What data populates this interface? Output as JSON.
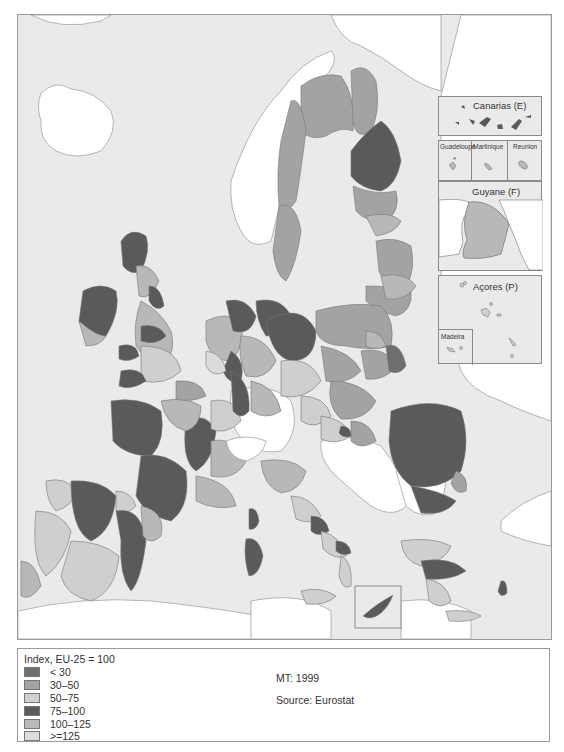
{
  "map": {
    "title": "Regional index map of the EU-25 (NUTS regions)",
    "sea_color": "#eaeaea",
    "non_eu_land_color": "#ffffff",
    "border_color": "#777777"
  },
  "insets": {
    "canarias": {
      "label": "Canarias (E)"
    },
    "guadeloupe": {
      "label": "Guadeloupe"
    },
    "martinique": {
      "label": "Martinique"
    },
    "reunion": {
      "label": "Reunion"
    },
    "guyane": {
      "label": "Guyane (F)"
    },
    "acores": {
      "label": "Açores (P)"
    },
    "madeira": {
      "label": "Madeira"
    },
    "cyprus": {
      "label": ""
    }
  },
  "legend": {
    "title": "Index, EU-25 = 100",
    "items": [
      {
        "label": "< 30",
        "color": "#6e6e6e"
      },
      {
        "label": "30–50",
        "color": "#a3a3a3"
      },
      {
        "label": "50–75",
        "color": "#cfcfcf"
      },
      {
        "label": "75–100",
        "color": "#5a5a5a"
      },
      {
        "label": "100–125",
        "color": "#b8b8b8"
      },
      {
        "label": ">=125",
        "color": "#dcdcdc"
      }
    ],
    "note": "MT: 1999",
    "source": "Source: Eurostat"
  },
  "caption": {
    "text": ""
  }
}
